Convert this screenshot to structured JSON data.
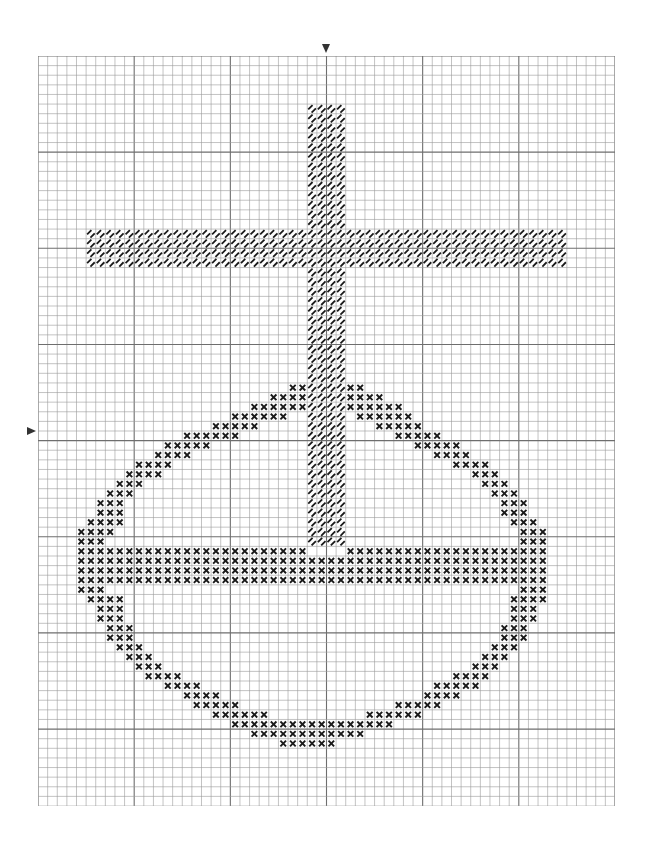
{
  "pattern": {
    "title": "Cross and circle cross-stitch chart",
    "grid": {
      "cols": 60,
      "rows": 78,
      "cell_px": 9.62,
      "major_every": 10,
      "line_color": "#9a9a9a",
      "major_line_color": "#6e6e6e"
    },
    "center_markers": {
      "top_marker_col": 29,
      "left_marker_row": 38
    },
    "symbols": {
      "backstitch_diagonal": {
        "name": "diagonal-hatch",
        "color": "#1a1a1a"
      },
      "cross_stitch": {
        "name": "x-mark",
        "color": "#1a1a1a"
      }
    },
    "cross": {
      "symbol": "backstitch_diagonal",
      "vertical_bar": {
        "col_start": 28,
        "col_end": 31,
        "row_start": 5,
        "row_end": 50
      },
      "horizontal_bar": {
        "col_start": 5,
        "col_end": 54,
        "row_start": 18,
        "row_end": 21
      }
    },
    "ring": {
      "symbol": "cross_stitch",
      "rows": [
        [
          34,
          [
            [
              26,
              27
            ],
            [
              32,
              33
            ]
          ]
        ],
        [
          35,
          [
            [
              24,
              27
            ],
            [
              32,
              35
            ]
          ]
        ],
        [
          36,
          [
            [
              22,
              27
            ],
            [
              32,
              37
            ]
          ]
        ],
        [
          37,
          [
            [
              20,
              25
            ],
            [
              33,
              38
            ]
          ]
        ],
        [
          38,
          [
            [
              18,
              22
            ],
            [
              35,
              39
            ]
          ]
        ],
        [
          39,
          [
            [
              15,
              20
            ],
            [
              37,
              41
            ]
          ]
        ],
        [
          40,
          [
            [
              13,
              17
            ],
            [
              39,
              43
            ]
          ]
        ],
        [
          41,
          [
            [
              12,
              15
            ],
            [
              41,
              44
            ]
          ]
        ],
        [
          42,
          [
            [
              10,
              13
            ],
            [
              43,
              46
            ]
          ]
        ],
        [
          43,
          [
            [
              9,
              12
            ],
            [
              45,
              47
            ]
          ]
        ],
        [
          44,
          [
            [
              8,
              10
            ],
            [
              46,
              48
            ]
          ]
        ],
        [
          45,
          [
            [
              7,
              9
            ],
            [
              47,
              49
            ]
          ]
        ],
        [
          46,
          [
            [
              6,
              8
            ],
            [
              48,
              50
            ]
          ]
        ],
        [
          47,
          [
            [
              6,
              8
            ],
            [
              48,
              50
            ]
          ]
        ],
        [
          48,
          [
            [
              5,
              8
            ],
            [
              49,
              51
            ]
          ]
        ],
        [
          49,
          [
            [
              4,
              7
            ],
            [
              50,
              52
            ]
          ]
        ],
        [
          50,
          [
            [
              4,
              6
            ],
            [
              50,
              52
            ]
          ]
        ],
        [
          51,
          [
            [
              4,
              27
            ],
            [
              32,
              52
            ]
          ]
        ],
        [
          52,
          [
            [
              4,
              52
            ]
          ]
        ],
        [
          53,
          [
            [
              4,
              52
            ]
          ]
        ],
        [
          54,
          [
            [
              4,
              52
            ]
          ]
        ],
        [
          55,
          [
            [
              4,
              6
            ],
            [
              50,
              52
            ]
          ]
        ],
        [
          56,
          [
            [
              5,
              8
            ],
            [
              49,
              52
            ]
          ]
        ],
        [
          57,
          [
            [
              6,
              8
            ],
            [
              49,
              51
            ]
          ]
        ],
        [
          58,
          [
            [
              6,
              8
            ],
            [
              49,
              51
            ]
          ]
        ],
        [
          59,
          [
            [
              7,
              9
            ],
            [
              48,
              50
            ]
          ]
        ],
        [
          60,
          [
            [
              7,
              9
            ],
            [
              48,
              50
            ]
          ]
        ],
        [
          61,
          [
            [
              8,
              10
            ],
            [
              47,
              49
            ]
          ]
        ],
        [
          62,
          [
            [
              9,
              11
            ],
            [
              46,
              48
            ]
          ]
        ],
        [
          63,
          [
            [
              10,
              12
            ],
            [
              45,
              47
            ]
          ]
        ],
        [
          64,
          [
            [
              11,
              14
            ],
            [
              43,
              46
            ]
          ]
        ],
        [
          65,
          [
            [
              13,
              16
            ],
            [
              41,
              45
            ]
          ]
        ],
        [
          66,
          [
            [
              15,
              18
            ],
            [
              40,
              43
            ]
          ]
        ],
        [
          67,
          [
            [
              16,
              20
            ],
            [
              37,
              41
            ]
          ]
        ],
        [
          68,
          [
            [
              18,
              23
            ],
            [
              34,
              39
            ]
          ]
        ],
        [
          69,
          [
            [
              20,
              36
            ]
          ]
        ],
        [
          70,
          [
            [
              22,
              33
            ]
          ]
        ],
        [
          71,
          [
            [
              25,
              30
            ]
          ]
        ]
      ]
    }
  }
}
